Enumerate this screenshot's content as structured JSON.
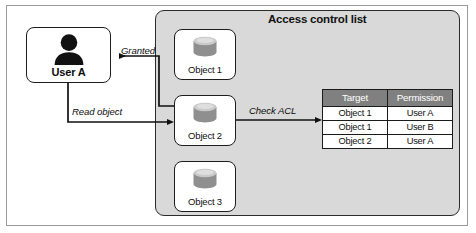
{
  "diagram": {
    "title": "Access control list",
    "actor": {
      "label": "User A",
      "icon": "user-icon"
    },
    "objects": [
      {
        "label": "Object 1",
        "icon": "database-icon"
      },
      {
        "label": "Object 2",
        "icon": "database-icon"
      },
      {
        "label": "Object 3",
        "icon": "database-icon"
      }
    ],
    "flows": [
      {
        "label": "Granted",
        "from": "Object 2",
        "to": "User A"
      },
      {
        "label": "Read object",
        "from": "User A",
        "to": "Object 2"
      },
      {
        "label": "Check ACL",
        "from": "Object 2",
        "to": "Access control list table"
      }
    ],
    "table": {
      "headers": [
        "Target",
        "Permission"
      ],
      "rows": [
        [
          "Object 1",
          "User A"
        ],
        [
          "Object 1",
          "User B"
        ],
        [
          "Object 2",
          "User A"
        ]
      ]
    },
    "colors": {
      "container_fill": "#d9d9d9",
      "table_header_fill": "#808080",
      "table_header_text": "#ffffff",
      "stroke": "#1d1d1d",
      "canvas": "#ffffff"
    }
  }
}
